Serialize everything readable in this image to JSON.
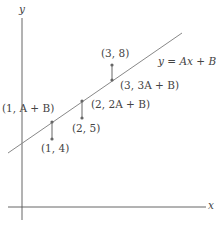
{
  "diagram": {
    "axes": {
      "x_label": "x",
      "y_label": "y"
    },
    "line_label": "y = Ax + B",
    "colors": {
      "axis": "#555555",
      "line": "#888888",
      "segment": "#666666",
      "text": "#444444"
    },
    "points": [
      {
        "data_label": "(1, 4)",
        "fit_label": "(1, A + B)"
      },
      {
        "data_label": "(2, 5)",
        "fit_label": "(2, 2A + B)"
      },
      {
        "data_label": "(3, 8)",
        "fit_label": "(3, 3A + B)"
      }
    ]
  }
}
